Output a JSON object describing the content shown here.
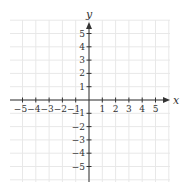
{
  "chart_data": {
    "type": "scatter",
    "title": "",
    "xlabel": "x",
    "ylabel": "y",
    "xlim": [
      -6,
      6
    ],
    "ylim": [
      -6,
      6
    ],
    "grid": true,
    "x_ticks": [
      -5,
      -4,
      -3,
      -2,
      -1,
      1,
      2,
      3,
      4,
      5
    ],
    "y_ticks": [
      5,
      4,
      3,
      2,
      1,
      -1,
      -2,
      -3,
      -4,
      -5
    ],
    "x_tick_labels": [
      "−5",
      "−4",
      "−3",
      "−2",
      "−1",
      "1",
      "2",
      "3",
      "4",
      "5"
    ],
    "y_tick_labels": [
      "5",
      "4",
      "3",
      "2",
      "1",
      "−1",
      "−2",
      "−3",
      "−4",
      "−5"
    ],
    "series": [],
    "colors": {
      "axis": "#333333",
      "grid": "#e8e8e8",
      "background": "#ffffff"
    }
  }
}
